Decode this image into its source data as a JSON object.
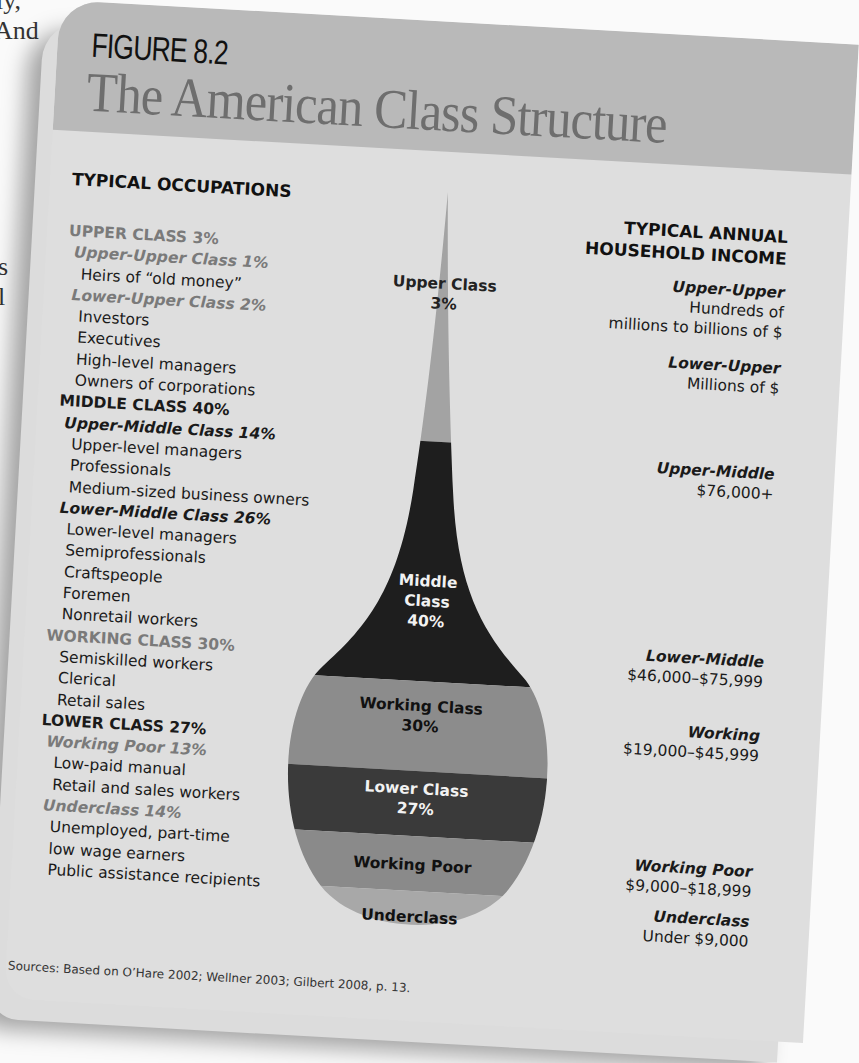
{
  "background_text": [
    "ly,",
    "And",
    "s",
    "l"
  ],
  "figure": {
    "label": "FIGURE 8.2",
    "title": "The American Class Structure"
  },
  "headers": {
    "occupations": "TYPICAL OCCUPATIONS",
    "income_line1": "TYPICAL ANNUAL",
    "income_line2": "HOUSEHOLD INCOME"
  },
  "occupations": [
    {
      "text": "UPPER CLASS  3%",
      "kind": "major",
      "tone": "gray"
    },
    {
      "text": "Upper-Upper Class  1%",
      "kind": "sub",
      "tone": "gray"
    },
    {
      "text": "Heirs of “old money”",
      "kind": "item"
    },
    {
      "text": "Lower-Upper Class  2%",
      "kind": "sub",
      "tone": "gray"
    },
    {
      "text": "Investors",
      "kind": "item"
    },
    {
      "text": "Executives",
      "kind": "item"
    },
    {
      "text": "High-level managers",
      "kind": "item"
    },
    {
      "text": "Owners of corporations",
      "kind": "item"
    },
    {
      "text": "MIDDLE CLASS  40%",
      "kind": "major",
      "tone": "dark"
    },
    {
      "text": "Upper-Middle Class  14%",
      "kind": "sub",
      "tone": "dark"
    },
    {
      "text": "Upper-level managers",
      "kind": "item"
    },
    {
      "text": "Professionals",
      "kind": "item"
    },
    {
      "text": "Medium-sized business owners",
      "kind": "item"
    },
    {
      "text": "Lower-Middle Class  26%",
      "kind": "sub",
      "tone": "dark"
    },
    {
      "text": "Lower-level managers",
      "kind": "item"
    },
    {
      "text": "Semiprofessionals",
      "kind": "item"
    },
    {
      "text": "Craftspeople",
      "kind": "item"
    },
    {
      "text": "Foremen",
      "kind": "item"
    },
    {
      "text": "Nonretail workers",
      "kind": "item"
    },
    {
      "text": "WORKING CLASS  30%",
      "kind": "major",
      "tone": "gray"
    },
    {
      "text": "Semiskilled workers",
      "kind": "item"
    },
    {
      "text": "Clerical",
      "kind": "item"
    },
    {
      "text": "Retail sales",
      "kind": "item"
    },
    {
      "text": "LOWER CLASS  27%",
      "kind": "major",
      "tone": "dark"
    },
    {
      "text": "Working Poor  13%",
      "kind": "sub",
      "tone": "gray"
    },
    {
      "text": "Low-paid manual",
      "kind": "item"
    },
    {
      "text": "Retail and sales workers",
      "kind": "item"
    },
    {
      "text": "Underclass  14%",
      "kind": "sub",
      "tone": "gray"
    },
    {
      "text": "Unemployed, part-time",
      "kind": "item"
    },
    {
      "text": "low wage earners",
      "kind": "item"
    },
    {
      "text": "Public assistance recipients",
      "kind": "item"
    }
  ],
  "incomes": [
    {
      "name": "Upper-Upper",
      "value": [
        "Hundreds of",
        "millions to billions of $"
      ]
    },
    {
      "name": "Lower-Upper",
      "value": [
        "Millions of $"
      ]
    },
    {
      "name": "Upper-Middle",
      "value": [
        "$76,000+"
      ]
    },
    {
      "name": "Lower-Middle",
      "value": [
        "$46,000–$75,999"
      ]
    },
    {
      "name": "Working",
      "value": [
        "$19,000–$45,999"
      ]
    },
    {
      "name": "Working Poor",
      "value": [
        "$9,000–$18,999"
      ]
    },
    {
      "name": "Underclass",
      "value": [
        "Under $9,000"
      ]
    }
  ],
  "drop_labels": [
    {
      "line1": "Upper Class",
      "line2": "3%"
    },
    {
      "line1": "Middle",
      "line2": "Class",
      "line3": "40%"
    },
    {
      "line1": "Working Class",
      "line2": "30%"
    },
    {
      "line1": "Lower Class",
      "line2": "27%"
    },
    {
      "line1": "Working Poor"
    },
    {
      "line1": "Underclass"
    }
  ],
  "colors": {
    "upper": "#a3a3a3",
    "middle": "#1e1e1e",
    "working": "#8c8c8c",
    "lower": "#3a3a3a",
    "working_poor": "#8a8a8a",
    "underclass": "#a8a8a8"
  },
  "source": "Sources: Based on O’Hare 2002; Wellner 2003; Gilbert 2008, p. 13.",
  "chart_data": {
    "type": "area",
    "title": "The American Class Structure",
    "subtitle": "FIGURE 8.2",
    "shape": "teardrop stacked proportion diagram",
    "categories": [
      "Upper Class",
      "Middle Class",
      "Working Class",
      "Lower Class"
    ],
    "values": [
      3,
      40,
      30,
      27
    ],
    "subcategories": [
      {
        "parent": "Upper Class",
        "name": "Upper-Upper Class",
        "percent": 1,
        "income": "Hundreds of millions to billions of $",
        "occupations": [
          "Heirs of “old money”"
        ]
      },
      {
        "parent": "Upper Class",
        "name": "Lower-Upper Class",
        "percent": 2,
        "income": "Millions of $",
        "occupations": [
          "Investors",
          "Executives",
          "High-level managers",
          "Owners of corporations"
        ]
      },
      {
        "parent": "Middle Class",
        "name": "Upper-Middle Class",
        "percent": 14,
        "income": "$76,000+",
        "occupations": [
          "Upper-level managers",
          "Professionals",
          "Medium-sized business owners"
        ]
      },
      {
        "parent": "Middle Class",
        "name": "Lower-Middle Class",
        "percent": 26,
        "income": "$46,000–$75,999",
        "occupations": [
          "Lower-level managers",
          "Semiprofessionals",
          "Craftspeople",
          "Foremen",
          "Nonretail workers"
        ]
      },
      {
        "parent": "Working Class",
        "name": "Working Class",
        "percent": 30,
        "income": "$19,000–$45,999",
        "occupations": [
          "Semiskilled workers",
          "Clerical",
          "Retail sales"
        ]
      },
      {
        "parent": "Lower Class",
        "name": "Working Poor",
        "percent": 13,
        "income": "$9,000–$18,999",
        "occupations": [
          "Low-paid manual",
          "Retail and sales workers"
        ]
      },
      {
        "parent": "Lower Class",
        "name": "Underclass",
        "percent": 14,
        "income": "Under $9,000",
        "occupations": [
          "Unemployed, part-time",
          "low wage earners",
          "Public assistance recipients"
        ]
      }
    ],
    "xlabel": "",
    "ylabel": "",
    "legend": "none",
    "grid": false
  }
}
